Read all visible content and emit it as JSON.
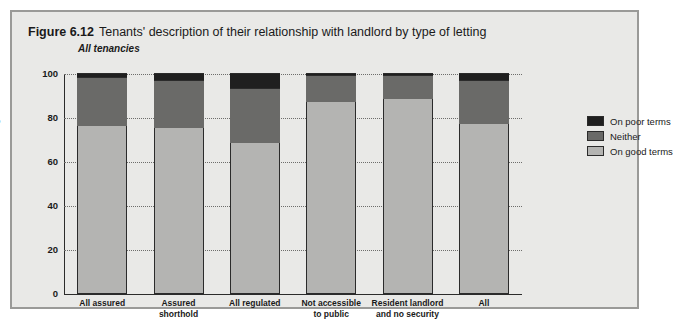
{
  "figure": {
    "number": "Figure 6.12",
    "title": "Tenants' description of their relationship with landlord by type of letting",
    "subtitle": "All tenancies"
  },
  "colors": {
    "panel_background": "#e9e9e7",
    "frame_border": "#9a9a98",
    "on_good_terms": "#b4b4b2",
    "neither": "#6a6a68",
    "on_poor_terms": "#1f1f1f",
    "axis": "#2b2b2b",
    "gridline": "#6d6d6b",
    "text": "#1a1a1a"
  },
  "legend": {
    "position": "right",
    "items": [
      {
        "label": "On poor terms",
        "key": "on_poor_terms",
        "color": "#1f1f1f"
      },
      {
        "label": "Neither",
        "key": "neither",
        "color": "#6a6a68"
      },
      {
        "label": "On good terms",
        "key": "on_good_terms",
        "color": "#b4b4b2"
      }
    ]
  },
  "chart_data": {
    "type": "bar",
    "stacked": true,
    "title": "Tenants' description of their relationship with landlord by type of letting",
    "subtitle": "All tenancies",
    "xlabel": "",
    "ylabel": "Percentage",
    "ylim": [
      0,
      100
    ],
    "yticks": [
      0,
      20,
      40,
      60,
      80,
      100
    ],
    "ytick_labels": [
      "0",
      "20",
      "40",
      "60",
      "80",
      "100"
    ],
    "grid": true,
    "grid_axis": "y",
    "categories": [
      "All assured",
      "Assured shorthold",
      "All regulated",
      "Not accessible to public",
      "Resident landlord and no security",
      "All"
    ],
    "category_lines": [
      [
        "All assured"
      ],
      [
        "Assured",
        "shorthold"
      ],
      [
        "All regulated"
      ],
      [
        "Not accessible",
        "to public"
      ],
      [
        "Resident landlord",
        "and no security"
      ],
      [
        "All"
      ]
    ],
    "series": [
      {
        "name": "On good terms",
        "values": [
          76,
          75,
          68,
          87,
          88,
          77
        ]
      },
      {
        "name": "Neither",
        "values": [
          22,
          22,
          25,
          12,
          11,
          20
        ]
      },
      {
        "name": "On poor terms",
        "values": [
          2,
          3,
          7,
          1,
          1,
          3
        ]
      }
    ]
  }
}
